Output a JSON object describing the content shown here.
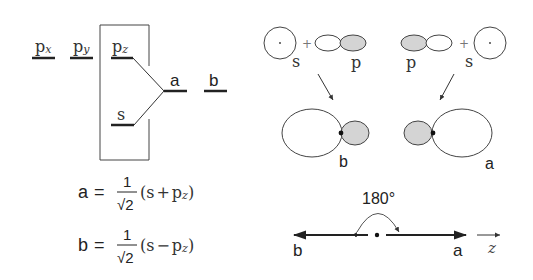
{
  "energy_diagram": {
    "levels": {
      "px": {
        "base": "p",
        "sub": "x"
      },
      "py": {
        "base": "p",
        "sub": "y"
      },
      "pz": {
        "base": "p",
        "sub": "z"
      },
      "s": "s",
      "a": "a",
      "b": "b"
    }
  },
  "equations": {
    "a": {
      "lhs": "a",
      "eq": "=",
      "num": "1",
      "den": "√2",
      "open": "(s",
      "op": "+",
      "p": "p",
      "sub": "z",
      "close": ")"
    },
    "b": {
      "lhs": "b",
      "eq": "=",
      "num": "1",
      "den": "√2",
      "open": "(s",
      "op": "−",
      "p": "p",
      "sub": "z",
      "close": ")"
    }
  },
  "orbitals": {
    "left_group": {
      "s_label": "s",
      "plus": "+",
      "p_label": "p",
      "result_label": "b"
    },
    "right_group": {
      "p_label": "p",
      "plus": "+",
      "s_label": "s",
      "result_label": "a"
    },
    "shade_color": "#d4d4d4",
    "line_color": "#333333"
  },
  "axis": {
    "angle_label": "180°",
    "left_label": "b",
    "right_label": "a",
    "axis_label": "z"
  }
}
